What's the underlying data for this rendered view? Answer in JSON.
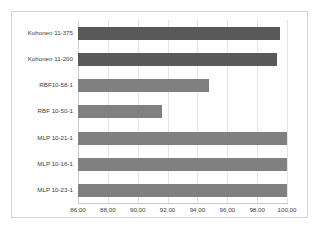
{
  "chart_data": {
    "type": "bar",
    "orientation": "horizontal",
    "title": "",
    "xlabel": "",
    "ylabel": "",
    "categories": [
      "Kohonen 11-375",
      "Kohonen 11-200",
      "RBF10-58-1",
      "RBF 10-50-1",
      "MLP 10-21-1",
      "MLP 10-16-1",
      "MLP 10-23-1"
    ],
    "values": [
      99.5,
      99.3,
      94.8,
      91.6,
      100.0,
      100.0,
      100.0
    ],
    "bar_colors": [
      "#595959",
      "#595959",
      "#808080",
      "#808080",
      "#808080",
      "#808080",
      "#808080"
    ],
    "xlim": [
      86.0,
      100.0
    ],
    "xticks": [
      86.0,
      88.0,
      90.0,
      92.0,
      94.0,
      96.0,
      98.0,
      100.0
    ],
    "xticklabels": [
      "86,00",
      "88,00",
      "90,00",
      "92,00",
      "94,00",
      "96,00",
      "98,00",
      "100,00"
    ],
    "grid": true,
    "legend": false,
    "accent_color": "#808080",
    "accent_color_dark": "#595959",
    "gridline_color": "#e4e4e4",
    "border_color": "#d4d4d4"
  }
}
